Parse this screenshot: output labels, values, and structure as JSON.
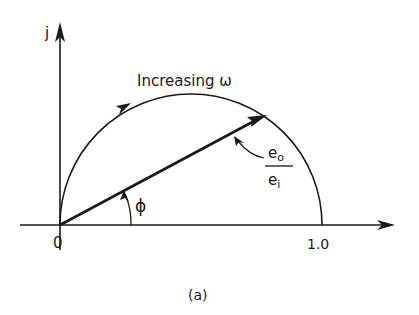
{
  "diagram": {
    "type": "phasor_locus",
    "caption": "(a)",
    "axes": {
      "vertical_label": "j",
      "origin_label": "0",
      "real_axis_mark": "1.0"
    },
    "locus": {
      "shape": "semicircle",
      "direction_label": "Increasing ω"
    },
    "phasor": {
      "numerator": "e",
      "numerator_sub": "o",
      "denominator": "e",
      "denominator_sub": "i"
    },
    "angle": {
      "label": "ϕ"
    },
    "colors": {
      "stroke": "#1a1a1a",
      "background": "#ffffff"
    }
  }
}
